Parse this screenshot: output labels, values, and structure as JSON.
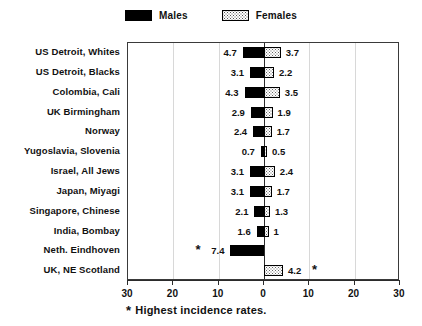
{
  "legend": {
    "items": [
      {
        "label": "Males",
        "swatch": "black-filled-square",
        "color": "#000000"
      },
      {
        "label": "Females",
        "swatch": "stippled-square",
        "color": "#dcdcdc"
      }
    ]
  },
  "axis": {
    "ticks": [
      "30",
      "20",
      "10",
      "0",
      "10",
      "20",
      "30"
    ]
  },
  "caption": {
    "star": "*",
    "text": "Highest incidence rates."
  },
  "chart_data": {
    "type": "bar",
    "orientation": "horizontal-diverging",
    "title": "",
    "subtitle": "",
    "xlabel": "",
    "ylabel": "",
    "xlim": [
      -30,
      30
    ],
    "xticks": [
      30,
      20,
      10,
      0,
      10,
      20,
      30
    ],
    "grid": true,
    "legend_position": "top-center",
    "note": "* Highest incidence rates.",
    "categories": [
      "US Detroit, Whites",
      "US Detroit, Blacks",
      "Colombia, Cali",
      "UK Birmingham",
      "Norway",
      "Yugoslavia, Slovenia",
      "Israel, All Jews",
      "Japan, Miyagi",
      "Singapore, Chinese",
      "India, Bombay",
      "Neth. Eindhoven",
      "UK, NE Scotland"
    ],
    "series": [
      {
        "name": "Males",
        "direction": "left",
        "color": "#000000",
        "values": [
          4.7,
          3.1,
          4.3,
          2.9,
          2.4,
          0.7,
          3.1,
          3.1,
          2.1,
          1.6,
          7.4,
          null
        ],
        "labels": [
          "4.7",
          "3.1",
          "4.3",
          "2.9",
          "2.4",
          "0.7",
          "3.1",
          "3.1",
          "2.1",
          "1.6",
          "7.4",
          ""
        ]
      },
      {
        "name": "Females",
        "direction": "right",
        "color": "#dcdcdc",
        "values": [
          3.7,
          2.2,
          3.5,
          1.9,
          1.7,
          0.5,
          2.4,
          1.7,
          1.3,
          1.0,
          null,
          4.2
        ],
        "labels": [
          "3.7",
          "2.2",
          "3.5",
          "1.9",
          "1.7",
          "0.5",
          "2.4",
          "1.7",
          "1.3",
          "1",
          "",
          "4.2"
        ]
      }
    ],
    "highest_incidence_markers": [
      {
        "category": "Neth. Eindhoven",
        "series": "Males",
        "marker": "*"
      },
      {
        "category": "UK, NE Scotland",
        "series": "Females",
        "marker": "*"
      }
    ]
  }
}
